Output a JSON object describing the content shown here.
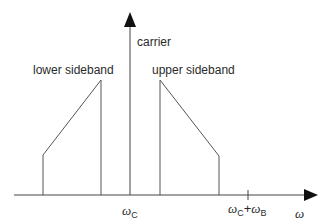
{
  "diagram": {
    "type": "frequency-spectrum",
    "labels": {
      "carrier": "carrier",
      "lower_sideband": "lower sideband",
      "upper_sideband": "upper sideband",
      "omega_c_sym": "ω",
      "omega_c_sub": "C",
      "omega_cb_sym1": "ω",
      "omega_cb_sub1": "C",
      "omega_cb_plus": "+",
      "omega_cb_sym2": "ω",
      "omega_cb_sub2": "B",
      "x_axis": "ω"
    },
    "colors": {
      "line": "#444444",
      "text": "#2a2a2a",
      "background": "#ffffff"
    },
    "geometry": {
      "axis_y": 195,
      "axis_x_start": 14,
      "axis_x_end": 318,
      "carrier_x": 130,
      "carrier_top": 12,
      "lower_sideband": [
        [
          43,
          195
        ],
        [
          43,
          155
        ],
        [
          101,
          80
        ],
        [
          101,
          195
        ]
      ],
      "upper_sideband": [
        [
          160,
          195
        ],
        [
          160,
          80
        ],
        [
          219,
          156
        ],
        [
          219,
          195
        ]
      ],
      "tick_x": 248
    }
  }
}
